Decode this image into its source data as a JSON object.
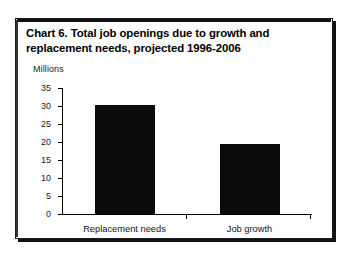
{
  "figure": {
    "title": "Chart 6. Total job openings due to growth and replacement needs, projected 1996-2006",
    "unit_label": "Millions"
  },
  "chart_data": {
    "type": "bar",
    "title": "Chart 6. Total job openings due to growth and replacement needs, projected 1996-2006",
    "categories": [
      "Replacement needs",
      "Job growth"
    ],
    "values": [
      30.3,
      19.5
    ],
    "xlabel": "",
    "ylabel": "Millions",
    "ylim": [
      0,
      35
    ],
    "yticks": [
      0,
      5,
      10,
      15,
      20,
      25,
      30,
      35
    ],
    "ytick_labels": [
      "0",
      "5",
      "10",
      "15",
      "20",
      "25",
      "30",
      "35"
    ],
    "grid": false,
    "legend": false,
    "bar_color": "#0c0c0c",
    "axis_color": "#000000",
    "background": "#ffffff"
  }
}
